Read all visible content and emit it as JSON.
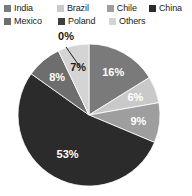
{
  "chart_data": {
    "type": "pie",
    "title": "",
    "legend_position": "top",
    "categories": [
      "India",
      "Brazil",
      "Chile",
      "China",
      "Mexico",
      "Poland",
      "Others"
    ],
    "values": [
      16,
      6,
      9,
      53,
      8,
      0,
      7
    ],
    "value_labels": [
      "16%",
      "6%",
      "9%",
      "53%",
      "8%",
      "0%",
      "7%"
    ],
    "colors": [
      "#7a7a7a",
      "#c9c9c9",
      "#9e9e9e",
      "#2b2b2b",
      "#6e6e6e",
      "#3f3f3f",
      "#d4d4d4"
    ],
    "label_colors": [
      "#ffffff",
      "#ffffff",
      "#ffffff",
      "#ffffff",
      "#ffffff",
      "#1a1a1a",
      "#1a1a1a"
    ],
    "start_angle_deg": 0,
    "direction": "clockwise",
    "units": "percent"
  },
  "legend": {
    "rows": [
      [
        {
          "label": "India",
          "color": "#7a7a7a"
        },
        {
          "label": "Brazil",
          "color": "#c9c9c9"
        },
        {
          "label": "Chile",
          "color": "#9e9e9e"
        },
        {
          "label": "China",
          "color": "#2b2b2b"
        }
      ],
      [
        {
          "label": "Mexico",
          "color": "#6e6e6e"
        },
        {
          "label": "Poland",
          "color": "#3f3f3f"
        },
        {
          "label": "Others",
          "color": "#d4d4d4"
        }
      ]
    ]
  },
  "callout": {
    "label": "0%",
    "for_category": "Poland"
  }
}
